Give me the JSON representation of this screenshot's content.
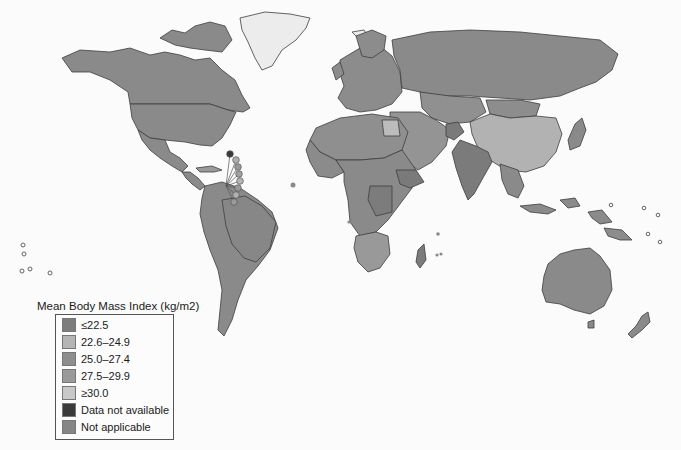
{
  "map": {
    "title": "Mean Body Mass Index (kg/m2)",
    "type": "choropleth world map",
    "colors": {
      "le_22_5": "#7d7d7d",
      "22_6_24_9": "#b5b5b5",
      "25_0_27_4": "#8e8e8e",
      "27_5_29_9": "#9a9a9a",
      "ge_30_0": "#c8c8c8",
      "no_data": "#3a3a3a",
      "not_applicable": "#858585",
      "greenland": "#ececec",
      "ocean": "#fbfbfb"
    },
    "callout": "Caribbean island states shown as circle markers"
  },
  "legend": {
    "title": "Mean Body Mass Index (kg/m2)",
    "items": [
      {
        "label": "≤22.5",
        "color": "#7d7d7d"
      },
      {
        "label": "22.6–24.9",
        "color": "#b5b5b5"
      },
      {
        "label": "25.0–27.4",
        "color": "#8e8e8e"
      },
      {
        "label": "27.5–29.9",
        "color": "#9a9a9a"
      },
      {
        "label": "≥30.0",
        "color": "#c8c8c8"
      },
      {
        "label": "Data not available",
        "color": "#3a3a3a"
      },
      {
        "label": "Not applicable",
        "color": "#858585"
      }
    ]
  }
}
